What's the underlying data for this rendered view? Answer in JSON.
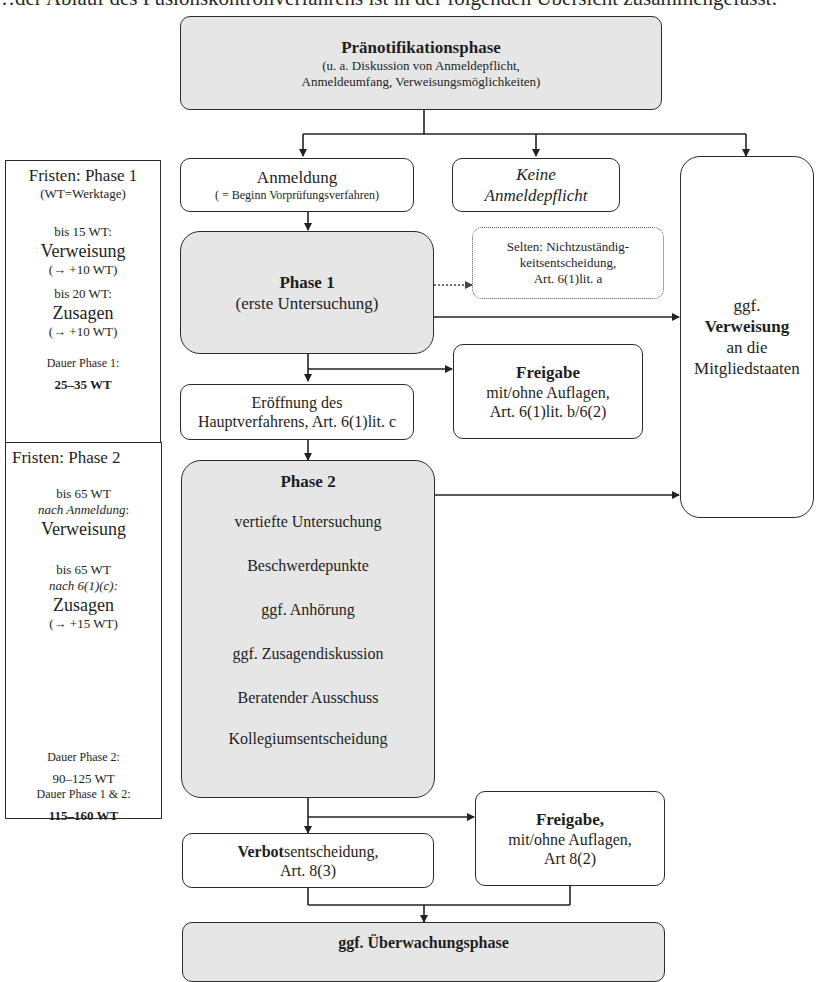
{
  "intro_text": "…der Ablauf des Fusionskontrollverfahrens ist in der folgenden Übersicht zusammengefasst:",
  "flow": {
    "pre_notification": {
      "title": "Pränotifikationsphase",
      "line1": "(u. a. Diskussion von Anmeldepflicht,",
      "line2": "Anmeldeumfang, Verweisungsmöglichkeiten)"
    },
    "notification": {
      "title": "Anmeldung",
      "subtitle": "( = Beginn Vorprüfungsverfahren)"
    },
    "no_notification": {
      "line1": "Keine",
      "line2": "Anmeldepflicht"
    },
    "referral": {
      "line1": "ggf.",
      "line2": "Verweisung",
      "line3": "an die",
      "line4": "Mitgliedstaaten"
    },
    "phase1": {
      "title": "Phase 1",
      "subtitle": "(erste Untersuchung)"
    },
    "non_competence": {
      "line1": "Selten: Nichtzuständig-",
      "line2": "keitsentscheidung,",
      "line3": "Art. 6(1)lit. a"
    },
    "clearance1": {
      "title": "Freigabe",
      "line1": "mit/ohne Auflagen,",
      "line2": "Art. 6(1)lit. b/6(2)"
    },
    "opening": {
      "line1": "Eröffnung des",
      "line2": "Hauptverfahrens, Art. 6(1)lit. c"
    },
    "phase2": {
      "title": "Phase 2",
      "items": [
        "vertiefte Untersuchung",
        "Beschwerdepunkte",
        "ggf. Anhörung",
        "ggf. Zusagendiskussion",
        "Beratender Ausschuss",
        "Kollegiumsentscheidung"
      ]
    },
    "prohibition": {
      "bold": "Verbot",
      "rest": "sentscheidung,",
      "line2": "Art. 8(3)"
    },
    "clearance2": {
      "title": "Freigabe,",
      "line1": "mit/ohne Auflagen,",
      "line2": "Art 8(2)"
    },
    "monitoring": {
      "title": "ggf. Überwachungsphase"
    }
  },
  "deadlines": {
    "phase1": {
      "title": "Fristen: Phase 1",
      "legend": "(WT=Werktage)",
      "referral_when": "bis 15 WT:",
      "referral_label": "Verweisung",
      "referral_ext": "(→ +10 WT)",
      "commit_when": "bis 20 WT:",
      "commit_label": "Zusagen",
      "commit_ext": "(→ +10 WT)",
      "duration_label": "Dauer Phase 1:",
      "duration_value": "25–35 WT"
    },
    "phase2": {
      "title": "Fristen: Phase 2",
      "referral_when": "bis 65 WT",
      "referral_ref": "nach Anmeldung",
      "referral_colon": ":",
      "referral_label": "Verweisung",
      "commit_when": "bis 65 WT",
      "commit_ref": "nach 6(1)(c):",
      "commit_label": "Zusagen",
      "commit_ext": "(→ +15 WT)",
      "duration_label": "Dauer Phase 2:",
      "duration_value": "90–125 WT",
      "total_label": "Dauer Phase 1 & 2:",
      "total_value": "115–160 WT"
    }
  }
}
